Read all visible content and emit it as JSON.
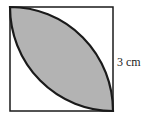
{
  "diagram": {
    "side_label": "3 cm",
    "colors": {
      "outline": "#1a1a1a",
      "shade": "#b3b3b3",
      "background": "#ffffff"
    }
  }
}
